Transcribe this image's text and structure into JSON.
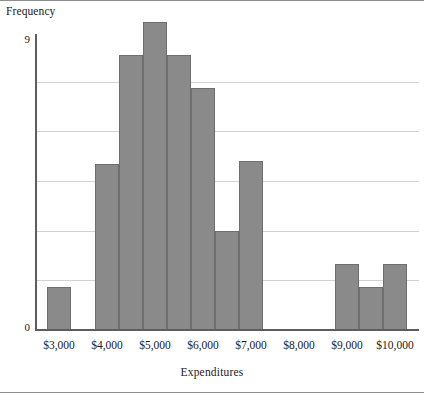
{
  "chart_data": {
    "type": "bar",
    "title": "",
    "xlabel": "Expenditures",
    "ylabel": "Frequency",
    "grid": true,
    "legend": "none",
    "xlim": [
      2500,
      10500
    ],
    "ylim": [
      0,
      9
    ],
    "y_tick_labels": [
      "0",
      "9"
    ],
    "y_gridline_values": [
      1.5,
      3.0,
      4.5,
      6.0,
      7.5
    ],
    "x_tick_labels": [
      "$3,000",
      "$4,000",
      "$5,000",
      "$6,000",
      "$7,000",
      "$8,000",
      "$9,000",
      "$10,000"
    ],
    "x_tick_values": [
      3000,
      4000,
      5000,
      6000,
      7000,
      8000,
      9000,
      10000
    ],
    "bin_width": 500,
    "bins": [
      {
        "start": 2750,
        "end": 3250,
        "label": "$2,750-$3,250",
        "value": 1.3
      },
      {
        "start": 3250,
        "end": 3750,
        "label": "$3,250-$3,750",
        "value": 0
      },
      {
        "start": 3750,
        "end": 4250,
        "label": "$3,750-$4,250",
        "value": 5.0
      },
      {
        "start": 4250,
        "end": 4750,
        "label": "$4,250-$4,750",
        "value": 8.3
      },
      {
        "start": 4750,
        "end": 5250,
        "label": "$4,750-$5,250",
        "value": 9.3
      },
      {
        "start": 5250,
        "end": 5750,
        "label": "$5,250-$5,750",
        "value": 8.3
      },
      {
        "start": 5750,
        "end": 6250,
        "label": "$5,750-$6,250",
        "value": 7.3
      },
      {
        "start": 6250,
        "end": 6750,
        "label": "$6,250-$6,750",
        "value": 3.0
      },
      {
        "start": 6750,
        "end": 7250,
        "label": "$6,750-$7,250",
        "value": 5.1
      },
      {
        "start": 7250,
        "end": 7750,
        "label": "$7,250-$7,750",
        "value": 0
      },
      {
        "start": 7750,
        "end": 8250,
        "label": "$7,750-$8,250",
        "value": 0
      },
      {
        "start": 8250,
        "end": 8750,
        "label": "$8,250-$8,750",
        "value": 0
      },
      {
        "start": 8750,
        "end": 9250,
        "label": "$8,750-$9,250",
        "value": 2.0
      },
      {
        "start": 9250,
        "end": 9750,
        "label": "$9,250-$9,750",
        "value": 1.3
      },
      {
        "start": 9750,
        "end": 10250,
        "label": "$9,750-$10,250",
        "value": 2.0
      }
    ],
    "colors": {
      "bar_fill": "#8a8a8a",
      "bar_edge": "#6e6e6e",
      "gridline": "#d2d2d2",
      "axis": "#5d5d5d",
      "text": "#1a1a1a",
      "background": "#ffffff"
    }
  }
}
